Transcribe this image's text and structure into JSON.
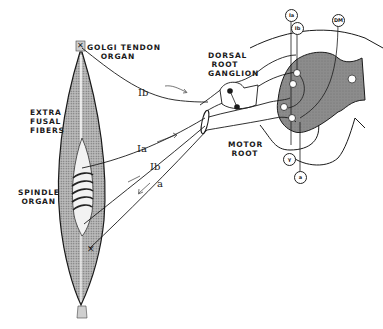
{
  "figure": {
    "type": "anatomical-diagram",
    "colors": {
      "ink": "#1a1a1a",
      "muscle_fill": "#9a9a9a",
      "gray_matter_fill": "#8a8a8a",
      "background": "#ffffff"
    }
  },
  "labels": {
    "golgi_tendon_organ": "GOLGI TENDON\n    ORGAN",
    "extra_fusal_fibers": "EXTRA\nFUSAL\nFIBERS",
    "spindle_organ": "SPINDLE\n ORGAN",
    "dorsal_root_ganglion": "DORSAL\n ROOT\nGANGLION",
    "motor_root": "MOTOR\n ROOT"
  },
  "fiber_labels": {
    "ib_top": "Ib",
    "ia": "Ia",
    "ib_lower": "Ib",
    "a": "a"
  },
  "circled_labels": {
    "ia": "Ia",
    "ib": "Ib",
    "dm": "DM",
    "gamma": "γ",
    "alpha": "a"
  }
}
